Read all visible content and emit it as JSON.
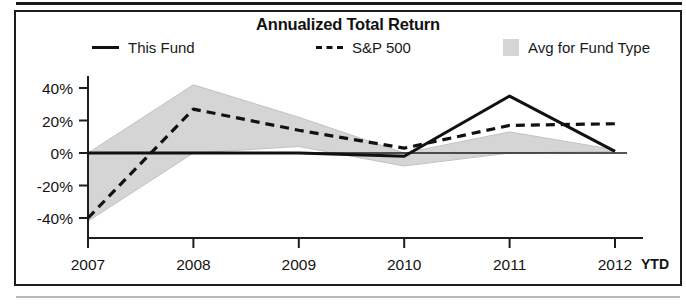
{
  "chart_data": {
    "type": "line",
    "title": "Annualized Total Return",
    "xlabel": "",
    "ylabel": "",
    "ylim": [
      -50,
      50
    ],
    "yticks": [
      40,
      20,
      0,
      -20,
      -40
    ],
    "ytick_labels": [
      "40%",
      "20%",
      "0%",
      "-20%",
      "-40%"
    ],
    "categories": [
      "2007",
      "2008",
      "2009",
      "2010",
      "2011",
      "2012"
    ],
    "x_axis_suffix": "YTD",
    "grid": false,
    "legend_position": "top",
    "series": [
      {
        "name": "This Fund",
        "style": "solid",
        "color": "#111111",
        "values": [
          0,
          0,
          0,
          -2,
          35,
          1
        ]
      },
      {
        "name": "S&P 500",
        "style": "dashed",
        "color": "#111111",
        "values": [
          -40,
          27,
          14,
          3,
          17,
          18
        ]
      },
      {
        "name": "Avg for Fund Type",
        "style": "band",
        "color": "#d5d5d5",
        "upper": [
          0,
          42,
          22,
          0,
          13,
          2
        ],
        "lower": [
          -42,
          0,
          4,
          -8,
          0,
          1
        ]
      }
    ]
  },
  "chart": {
    "title": "Annualized Total Return",
    "legend": [
      {
        "label": "This Fund",
        "marker": "solid-line-swatch"
      },
      {
        "label": "S&P 500",
        "marker": "dashed-line-swatch"
      },
      {
        "label": "Avg for Fund Type",
        "marker": "shaded-box-swatch"
      }
    ],
    "y_ticks": [
      "40%",
      "20%",
      "0%",
      "-20%",
      "-40%"
    ],
    "x_ticks": [
      "2007",
      "2008",
      "2009",
      "2010",
      "2011",
      "2012"
    ],
    "x_suffix": "YTD"
  }
}
